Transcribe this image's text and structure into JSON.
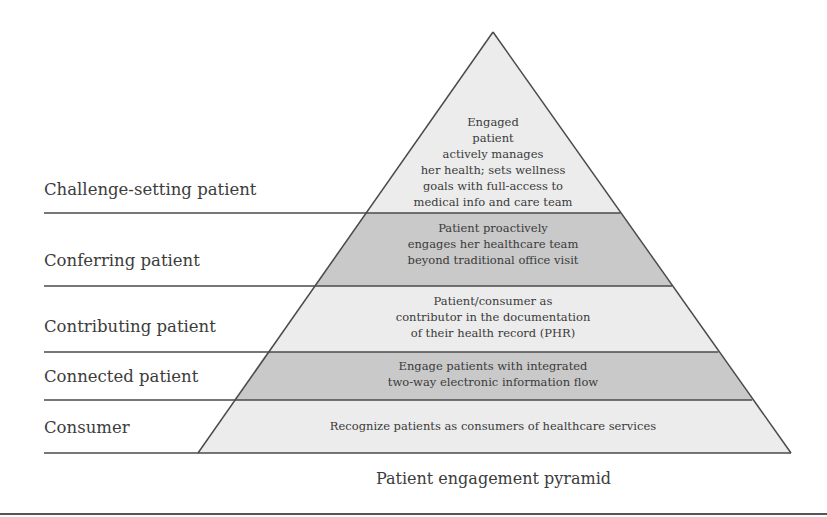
{
  "diagram": {
    "caption": "Patient engagement pyramid",
    "colors": {
      "light_band": "#ececec",
      "dark_band": "#c9c9c9",
      "outline": "#4a4a4a",
      "text": "#3a3a3a"
    },
    "levels": [
      {
        "label": "Challenge-setting patient",
        "fill": "light",
        "description_lines": [
          "Engaged",
          "patient",
          "actively manages",
          "her health; sets wellness",
          "goals with full-access to",
          "medical info and care team"
        ]
      },
      {
        "label": "Conferring patient",
        "fill": "dark",
        "description_lines": [
          "Patient proactively",
          "engages her healthcare team",
          "beyond traditional office visit"
        ]
      },
      {
        "label": "Contributing patient",
        "fill": "light",
        "description_lines": [
          "Patient/consumer as",
          "contributor in the documentation",
          "of their health record (PHR)"
        ]
      },
      {
        "label": "Connected patient",
        "fill": "dark",
        "description_lines": [
          "Engage patients with integrated",
          "two-way electronic information flow"
        ]
      },
      {
        "label": "Consumer",
        "fill": "light",
        "description_lines": [
          "Recognize patients as consumers of healthcare services"
        ]
      }
    ]
  }
}
